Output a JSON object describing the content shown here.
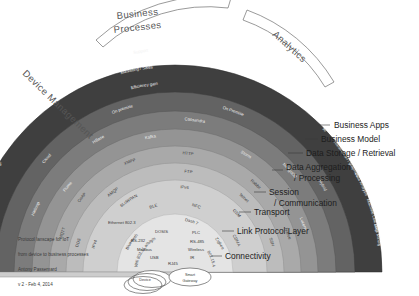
{
  "caption": {
    "line1": "Protocol lanscape for IoT",
    "line2": "from device to business processes",
    "line3": "Antony Passemard",
    "line4": "v 2 - Feb 4, 2014"
  },
  "categories": [
    {
      "id": "device-management",
      "label": "Device Management"
    },
    {
      "id": "business-processes",
      "label": "Business Processes"
    },
    {
      "id": "analytics",
      "label": "Analytics"
    }
  ],
  "side_labels": [
    {
      "id": "business-apps",
      "label": "Business Apps"
    },
    {
      "id": "business-model",
      "label": "Business Model"
    },
    {
      "id": "data-storage-retrieval",
      "label": "Data Storage / Retrieval"
    },
    {
      "id": "data-aggregation-processing",
      "label": "Data Aggregation\n/ Processing"
    },
    {
      "id": "session-communication",
      "label": "Session\n/ Communication"
    },
    {
      "id": "transport",
      "label": "Transport"
    },
    {
      "id": "link-protocol-layer",
      "label": "Link Protocol Layer"
    },
    {
      "id": "connectivity",
      "label": "Connectivity"
    }
  ],
  "hub_nodes": [
    {
      "id": "device",
      "label": "Device"
    },
    {
      "id": "smart-gateway",
      "label": "Smart\nGateway"
    }
  ],
  "bands": [
    {
      "id": "business-apps-band",
      "name": "Business Apps",
      "color": "#3f3f3f",
      "items": [
        {
          "label": "Security Control",
          "group": "device-management"
        },
        {
          "label": "Device Registration",
          "group": "device-management"
        },
        {
          "label": "Device Provisioning",
          "group": "device-management"
        },
        {
          "label": "Firmware Mgt",
          "group": "device-management"
        },
        {
          "label": "Asset Mgt",
          "group": "device-management"
        },
        {
          "label": "Support",
          "group": "business-processes"
        },
        {
          "label": "Marketing / Sales",
          "group": "business-processes"
        },
        {
          "label": "Efficiency gain",
          "group": "business-processes"
        },
        {
          "label": "AI",
          "group": "analytics"
        },
        {
          "label": "Visualization / graphics",
          "group": "analytics"
        },
        {
          "label": "Data Analysis",
          "group": "analytics"
        },
        {
          "label": "Machine Learning",
          "group": "analytics"
        },
        {
          "label": "Data Mining",
          "group": "analytics"
        }
      ]
    },
    {
      "id": "business-model-band",
      "name": "Business Model",
      "color": "#6b6b6b",
      "items": [
        {
          "label": "Cloud"
        },
        {
          "label": "On premise"
        },
        {
          "label": "On Premise"
        },
        {
          "label": "Hybrid"
        }
      ]
    },
    {
      "id": "data-storage-band",
      "name": "Data Storage / Retrieval",
      "color": "#8a8a8a",
      "items": [
        {
          "label": "Hadoop"
        },
        {
          "label": "HBase"
        },
        {
          "label": "Cassandra"
        },
        {
          "label": "MongoDB"
        }
      ]
    },
    {
      "id": "data-aggregation-band",
      "name": "Data Aggregation / Processing",
      "color": "#9e9e9e",
      "items": [
        {
          "label": "Flume"
        },
        {
          "label": "Kafka"
        },
        {
          "label": "Storm"
        },
        {
          "label": "Lucene"
        }
      ]
    },
    {
      "id": "session-band",
      "name": "Session / Communication",
      "color": "#b6b6b6",
      "items": [
        {
          "label": "Native"
        },
        {
          "label": "Rabbit"
        },
        {
          "label": "MQTT"
        }
      ]
    },
    {
      "id": "transport-band",
      "name": "Transport",
      "color": "#c4c4c4",
      "items": [
        {
          "label": "CoAP"
        },
        {
          "label": "XMPP"
        },
        {
          "label": "HTTP"
        },
        {
          "label": "DDS"
        },
        {
          "label": "AMQP"
        },
        {
          "label": "FTP"
        },
        {
          "label": "Telnet"
        },
        {
          "label": "SSH"
        }
      ]
    },
    {
      "id": "link-protocol-band",
      "name": "Link Protocol Layer",
      "color": "#d2d2d2",
      "items": [
        {
          "label": "IPv4"
        },
        {
          "label": "6LoWPAN"
        },
        {
          "label": "IPv6"
        },
        {
          "label": "NFC"
        },
        {
          "label": "BLE"
        },
        {
          "label": "RFID"
        },
        {
          "label": "GSM"
        },
        {
          "label": "CDMA"
        },
        {
          "label": "Bluetooth"
        },
        {
          "label": "Dash 7"
        },
        {
          "label": "Zigbee"
        },
        {
          "label": "Wifi 802.11 a/b/g/n"
        },
        {
          "label": "802.15.4"
        },
        {
          "label": "Ethernet 802.3"
        }
      ]
    },
    {
      "id": "connectivity-band",
      "name": "Connectivity",
      "color": "#e2e2e2",
      "items": [
        {
          "label": "DOSIS"
        },
        {
          "label": "PLC"
        },
        {
          "label": "RS-232"
        },
        {
          "label": "RS-485"
        },
        {
          "label": "Modbus"
        },
        {
          "label": "Wireless"
        },
        {
          "label": "USB"
        },
        {
          "label": "IR"
        },
        {
          "label": "RJ45"
        }
      ]
    }
  ]
}
